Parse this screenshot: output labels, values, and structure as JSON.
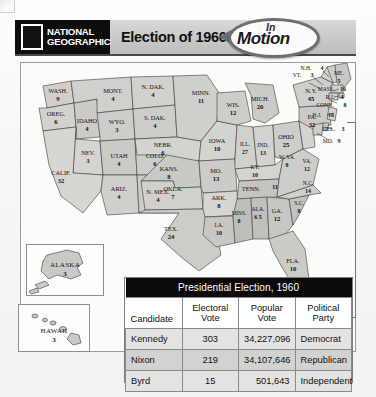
{
  "header": {
    "brand_line1": "NATIONAL",
    "brand_line2": "GEOGRAPHIC",
    "title": "Election of 1960",
    "badge_line1": "In",
    "badge_line2": "Motion",
    "logo_icon": "national-geographic-rectangle-logo",
    "arrow_icon": "left-arrow-icon"
  },
  "map": {
    "states": [
      {
        "abbr": "WASH.",
        "votes": "9"
      },
      {
        "abbr": "OREG.",
        "votes": "6"
      },
      {
        "abbr": "IDAHO",
        "votes": "4"
      },
      {
        "abbr": "MONT.",
        "votes": "4"
      },
      {
        "abbr": "WYO.",
        "votes": "3"
      },
      {
        "abbr": "NEV.",
        "votes": "3"
      },
      {
        "abbr": "UTAH",
        "votes": "4"
      },
      {
        "abbr": "COLO.",
        "votes": "6"
      },
      {
        "abbr": "CALIF.",
        "votes": "32"
      },
      {
        "abbr": "ARIZ.",
        "votes": "4"
      },
      {
        "abbr": "N. MEX.",
        "votes": "4"
      },
      {
        "abbr": "N. DAK.",
        "votes": "4"
      },
      {
        "abbr": "S. DAK.",
        "votes": "4"
      },
      {
        "abbr": "NEBR.",
        "votes": "6"
      },
      {
        "abbr": "KANS.",
        "votes": "8"
      },
      {
        "abbr": "OKLA.",
        "votes": "7"
      },
      {
        "abbr": "TEX.",
        "votes": "24"
      },
      {
        "abbr": "MINN.",
        "votes": "11"
      },
      {
        "abbr": "IOWA",
        "votes": "10"
      },
      {
        "abbr": "MO.",
        "votes": "13"
      },
      {
        "abbr": "ARK.",
        "votes": "8"
      },
      {
        "abbr": "LA.",
        "votes": "10"
      },
      {
        "abbr": "WIS.",
        "votes": "12"
      },
      {
        "abbr": "ILL.",
        "votes": "27"
      },
      {
        "abbr": "MICH.",
        "votes": "20"
      },
      {
        "abbr": "IND.",
        "votes": "13"
      },
      {
        "abbr": "OHIO",
        "votes": "25"
      },
      {
        "abbr": "KY.",
        "votes": "10"
      },
      {
        "abbr": "TENN.",
        "votes": "11"
      },
      {
        "abbr": "MISS.",
        "votes": "8"
      },
      {
        "abbr": "ALA.",
        "votes": "6 5"
      },
      {
        "abbr": "GA.",
        "votes": "12"
      },
      {
        "abbr": "FLA.",
        "votes": "10"
      },
      {
        "abbr": "S.C.",
        "votes": "8"
      },
      {
        "abbr": "N.C.",
        "votes": "14"
      },
      {
        "abbr": "VA.",
        "votes": "12"
      },
      {
        "abbr": "W. VA.",
        "votes": "8"
      },
      {
        "abbr": "PA.",
        "votes": "32"
      },
      {
        "abbr": "N.Y.",
        "votes": "45"
      },
      {
        "abbr": "VT.",
        "votes": "3"
      },
      {
        "abbr": "N.H.",
        "votes": "4"
      },
      {
        "abbr": "ME.",
        "votes": "5"
      },
      {
        "abbr": "MASS.",
        "votes": "16"
      },
      {
        "abbr": "R.I.",
        "votes": "4"
      },
      {
        "abbr": "CONN.",
        "votes": "8"
      },
      {
        "abbr": "N.J.",
        "votes": "16"
      },
      {
        "abbr": "DEL.",
        "votes": "3"
      },
      {
        "abbr": "MD.",
        "votes": "9"
      }
    ],
    "insets": [
      {
        "name": "ALASKA",
        "votes": "3"
      },
      {
        "name": "HAWAII",
        "votes": "3"
      }
    ]
  },
  "table": {
    "title": "Presidential Election, 1960",
    "columns": [
      "Candidate",
      "Electoral Vote",
      "Popular Vote",
      "Political Party"
    ],
    "columns_split": [
      {
        "l1": "Candidate",
        "l2": ""
      },
      {
        "l1": "Electoral",
        "l2": "Vote"
      },
      {
        "l1": "Popular",
        "l2": "Vote"
      },
      {
        "l1": "Political",
        "l2": "Party"
      }
    ],
    "rows": [
      {
        "candidate": "Kennedy",
        "electoral": "303",
        "popular": "34,227,096",
        "party": "Democrat"
      },
      {
        "candidate": "Nixon",
        "electoral": "219",
        "popular": "34,107,646",
        "party": "Republican"
      },
      {
        "candidate": "Byrd",
        "electoral": "15",
        "popular": "501,643",
        "party": "Independent"
      }
    ]
  }
}
